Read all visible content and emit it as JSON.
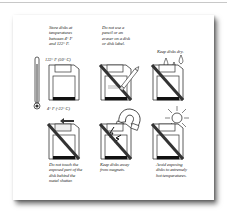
{
  "page": {
    "type": "manual-page-illustration"
  },
  "panels": [
    {
      "id": "temperature",
      "caption": "Store disks at temperatures between 4° F and 122° F.",
      "caption_lines": [
        "Store disks at",
        "temperatures",
        "between 4° F",
        "and 122° F."
      ],
      "labels": {
        "high": "122° F (50° C)",
        "low": "4° F (-22° C)"
      },
      "icon": "thermometer-icon",
      "prohibited": false
    },
    {
      "id": "no-pencil",
      "caption": "Do not use a pencil or an eraser on a disk or disk label.",
      "caption_lines": [
        "Do not use a",
        "pencil or an",
        "eraser on a disk",
        "or disk label."
      ],
      "icon": "pencil-icon",
      "prohibited": true
    },
    {
      "id": "keep-dry",
      "caption": "Keep disks dry.",
      "caption_lines": [
        "Keep disks dry."
      ],
      "icon": "water-drops-icon",
      "prohibited": true
    },
    {
      "id": "no-shutter-touch",
      "caption": "Do not touch the exposed part of the disk behind the metal shutter.",
      "caption_lines": [
        "Do not touch the",
        "exposed part of the",
        "disk behind the",
        "metal shutter."
      ],
      "icon": "arrow-left-icon",
      "prohibited": true
    },
    {
      "id": "no-magnets",
      "caption": "Keep disks away from magnets.",
      "caption_lines": [
        "Keep disks away",
        "from magnets."
      ],
      "icon": "magnet-icon",
      "prohibited": true
    },
    {
      "id": "no-heat",
      "caption": "Avoid exposing disks to extremely hot temperatures.",
      "caption_lines": [
        "Avoid exposing",
        "disks to extremely",
        "hot temperatures."
      ],
      "icon": "sun-icon",
      "prohibited": true
    }
  ],
  "colors": {
    "ink": "#222222",
    "paper": "#ffffff",
    "rule": "#c8c8c8"
  }
}
